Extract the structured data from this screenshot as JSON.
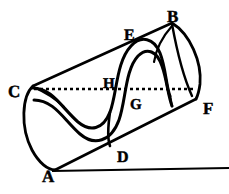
{
  "figure": {
    "background_color": "#ffffff",
    "ink_color": "#000000",
    "width": 229,
    "height": 194,
    "labels": [
      {
        "id": "A",
        "text": "A",
        "x": 42,
        "y": 168,
        "size": 17
      },
      {
        "id": "B",
        "text": "B",
        "x": 167,
        "y": 8,
        "size": 17
      },
      {
        "id": "C",
        "text": "C",
        "x": 8,
        "y": 83,
        "size": 17
      },
      {
        "id": "D",
        "text": "D",
        "x": 117,
        "y": 150,
        "size": 16
      },
      {
        "id": "E",
        "text": "E",
        "x": 124,
        "y": 28,
        "size": 16
      },
      {
        "id": "F",
        "text": "F",
        "x": 203,
        "y": 100,
        "size": 17
      },
      {
        "id": "G",
        "text": "G",
        "x": 130,
        "y": 98,
        "size": 15
      },
      {
        "id": "H",
        "text": "H",
        "x": 103,
        "y": 77,
        "size": 15
      }
    ],
    "elements": {
      "upper_edge": "line C to B",
      "lower_edge": "line A to F",
      "axis": "dotted line C to F through H and G",
      "baseline": "horizontal line from A to right margin",
      "chord_bf": "line B to F",
      "left_cap": "elliptical arc C to A",
      "right_cap": "elliptical arc B to F",
      "band": "sinusoidal double-line band wrapping the cylinder"
    }
  }
}
